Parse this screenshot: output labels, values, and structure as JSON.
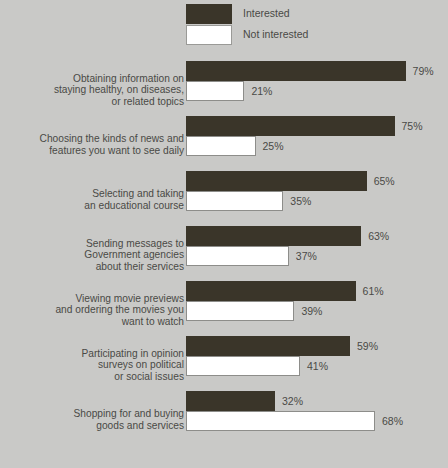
{
  "legend": {
    "items": [
      {
        "label": "Interested",
        "swatch": "dark",
        "color": "#3a3529"
      },
      {
        "label": "Not interested",
        "swatch": "light",
        "color": "#ffffff"
      }
    ]
  },
  "colors": {
    "background": "#c9c9c7",
    "interested": "#3a3529",
    "not_interested": "#ffffff",
    "text": "#4a4a46",
    "bar_outline": "#8d8d8a"
  },
  "chart_data": {
    "type": "bar",
    "title": "",
    "subtitle": "",
    "xlabel": "",
    "ylabel": "",
    "xlim": [
      0,
      100
    ],
    "grid": false,
    "orientation": "horizontal",
    "legend_position": "top",
    "value_suffix": "%",
    "categories": [
      "Obtaining information on staying healthy, on diseases, or related topics",
      "Choosing the kinds of news and features you want to see daily",
      "Selecting and taking an educational course",
      "Sending messages to Government agencies about their services",
      "Viewing movie previews and ordering the movies you want to watch",
      "Participating in opinion surveys on political or social issues",
      "Shopping for and buying goods and services"
    ],
    "category_lines": [
      [
        "Obtaining information on",
        "staying healthy, on diseases,",
        "or related topics"
      ],
      [
        "Choosing the kinds of news and",
        "features you want to see daily"
      ],
      [
        "Selecting and taking",
        "an educational course"
      ],
      [
        "Sending messages to",
        "Government agencies",
        "about their services"
      ],
      [
        "Viewing movie previews",
        "and ordering the movies you",
        "want to watch"
      ],
      [
        "Participating in opinion",
        "surveys on political",
        "or social issues"
      ],
      [
        "Shopping for and buying",
        "goods and services"
      ]
    ],
    "series": [
      {
        "name": "Interested",
        "values": [
          79,
          75,
          65,
          63,
          61,
          59,
          32
        ],
        "labels": [
          "79%",
          "75%",
          "65%",
          "63%",
          "61%",
          "59%",
          "32%"
        ]
      },
      {
        "name": "Not interested",
        "values": [
          21,
          25,
          35,
          37,
          39,
          41,
          68
        ],
        "labels": [
          "21%",
          "25%",
          "35%",
          "37%",
          "39%",
          "41%",
          "68%"
        ]
      }
    ]
  }
}
